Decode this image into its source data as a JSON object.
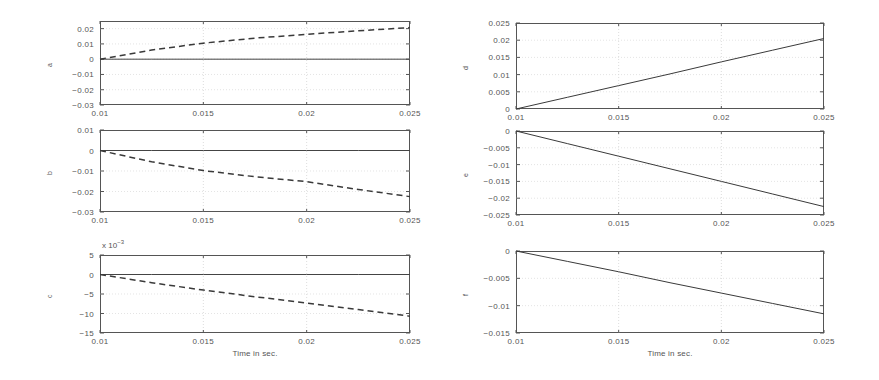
{
  "figure": {
    "background": "#ffffff",
    "ink_color": "#3a3a3a",
    "grid_color": "#cfcfcf"
  },
  "axis_common": {
    "xlabel": "Time in sec.",
    "xticks": [
      "0.01",
      "0.015",
      "0.02",
      "0.025"
    ],
    "xlim": [
      0.01,
      0.025
    ]
  },
  "chart_data": [
    {
      "id": "panel-a",
      "type": "line",
      "title": "",
      "xlabel": "",
      "ylabel": "a",
      "xlim": [
        0.01,
        0.025
      ],
      "ylim": [
        -0.03,
        0.025
      ],
      "xticks": [
        "0.01",
        "0.015",
        "0.02",
        "0.025"
      ],
      "yticks": [
        "0.02",
        "0.01",
        "0",
        "-0.01",
        "-0.02",
        "-0.03"
      ],
      "ytick_values": [
        0.02,
        0.01,
        0,
        -0.01,
        -0.02,
        -0.03
      ],
      "grid": true,
      "legend": "none",
      "exponent_label": "",
      "series": [
        {
          "name": "zero-reference",
          "style": "solid",
          "x": [
            0.01,
            0.0125,
            0.015,
            0.0175,
            0.02,
            0.0225,
            0.025
          ],
          "values": [
            0,
            0,
            0,
            0,
            0,
            0,
            0
          ]
        },
        {
          "name": "a-dashed",
          "style": "dashed",
          "x": [
            0.01,
            0.0125,
            0.015,
            0.0175,
            0.02,
            0.0225,
            0.025
          ],
          "values": [
            0.0,
            0.006,
            0.0105,
            0.0138,
            0.0163,
            0.0186,
            0.0207
          ]
        }
      ]
    },
    {
      "id": "panel-b",
      "type": "line",
      "title": "",
      "xlabel": "",
      "ylabel": "b",
      "xlim": [
        0.01,
        0.025
      ],
      "ylim": [
        -0.03,
        0.01
      ],
      "xticks": [
        "0.01",
        "0.015",
        "0.02",
        "0.025"
      ],
      "yticks": [
        "0.01",
        "0",
        "-0.01",
        "-0.02",
        "-0.03"
      ],
      "ytick_values": [
        0.01,
        0,
        -0.01,
        -0.02,
        -0.03
      ],
      "grid": true,
      "legend": "none",
      "exponent_label": "",
      "series": [
        {
          "name": "zero-reference",
          "style": "solid",
          "x": [
            0.01,
            0.0125,
            0.015,
            0.0175,
            0.02,
            0.0225,
            0.025
          ],
          "values": [
            0,
            0,
            0,
            0,
            0,
            0,
            0
          ]
        },
        {
          "name": "b-dashed",
          "style": "dashed",
          "x": [
            0.01,
            0.0125,
            0.015,
            0.0175,
            0.02,
            0.0225,
            0.025
          ],
          "values": [
            0.0,
            -0.0055,
            -0.0098,
            -0.0128,
            -0.0152,
            -0.019,
            -0.0225
          ]
        }
      ]
    },
    {
      "id": "panel-c",
      "type": "line",
      "title": "",
      "xlabel": "Time in sec.",
      "ylabel": "c",
      "xlim": [
        0.01,
        0.025
      ],
      "ylim": [
        -15,
        5
      ],
      "xticks": [
        "0.01",
        "0.015",
        "0.02",
        "0.025"
      ],
      "yticks": [
        "5",
        "0",
        "-5",
        "-10",
        "-15"
      ],
      "ytick_values": [
        5,
        0,
        -5,
        -10,
        -15
      ],
      "grid": true,
      "legend": "none",
      "exponent_label": "x 10",
      "exponent_power": "-3",
      "series": [
        {
          "name": "zero-reference",
          "style": "solid",
          "x": [
            0.01,
            0.0125,
            0.015,
            0.0175,
            0.02,
            0.0225,
            0.025
          ],
          "values": [
            0,
            0,
            0,
            0,
            0,
            0,
            0
          ]
        },
        {
          "name": "c-dashed",
          "style": "dashed",
          "x": [
            0.01,
            0.0125,
            0.015,
            0.0175,
            0.02,
            0.0225,
            0.025
          ],
          "values": [
            0.0,
            -2.1,
            -4.0,
            -5.7,
            -7.3,
            -9.0,
            -10.7
          ]
        }
      ]
    },
    {
      "id": "panel-d",
      "type": "line",
      "title": "",
      "xlabel": "",
      "ylabel": "d",
      "xlim": [
        0.01,
        0.025
      ],
      "ylim": [
        0,
        0.025
      ],
      "xticks": [
        "0.01",
        "0.015",
        "0.02",
        "0.025"
      ],
      "yticks": [
        "0.025",
        "0.02",
        "0.015",
        "0.01",
        "0.005",
        "0"
      ],
      "ytick_values": [
        0.025,
        0.02,
        0.015,
        0.01,
        0.005,
        0
      ],
      "grid": true,
      "legend": "none",
      "exponent_label": "",
      "series": [
        {
          "name": "d-solid",
          "style": "solid",
          "x": [
            0.01,
            0.0125,
            0.015,
            0.0175,
            0.02,
            0.0225,
            0.025
          ],
          "values": [
            0.0,
            0.0034,
            0.0068,
            0.0102,
            0.0137,
            0.0171,
            0.0205
          ]
        }
      ]
    },
    {
      "id": "panel-e",
      "type": "line",
      "title": "",
      "xlabel": "",
      "ylabel": "e",
      "xlim": [
        0.01,
        0.025
      ],
      "ylim": [
        -0.025,
        0
      ],
      "xticks": [
        "0.01",
        "0.015",
        "0.02",
        "0.025"
      ],
      "yticks": [
        "0",
        "-0.005",
        "-0.01",
        "-0.015",
        "-0.02",
        "-0.025"
      ],
      "ytick_values": [
        0,
        -0.005,
        -0.01,
        -0.015,
        -0.02,
        -0.025
      ],
      "grid": true,
      "legend": "none",
      "exponent_label": "",
      "series": [
        {
          "name": "e-solid",
          "style": "solid",
          "x": [
            0.01,
            0.0125,
            0.015,
            0.0175,
            0.02,
            0.0225,
            0.025
          ],
          "values": [
            0.0,
            -0.00375,
            -0.0075,
            -0.01125,
            -0.015,
            -0.01875,
            -0.0225
          ]
        }
      ]
    },
    {
      "id": "panel-f",
      "type": "line",
      "title": "",
      "xlabel": "Time in sec.",
      "ylabel": "f",
      "xlim": [
        0.01,
        0.025
      ],
      "ylim": [
        -0.015,
        0
      ],
      "xticks": [
        "0.01",
        "0.015",
        "0.02",
        "0.025"
      ],
      "yticks": [
        "0",
        "-0.005",
        "-0.01",
        "-0.015"
      ],
      "ytick_values": [
        0,
        -0.005,
        -0.01,
        -0.015
      ],
      "grid": true,
      "legend": "none",
      "exponent_label": "",
      "series": [
        {
          "name": "f-solid",
          "style": "solid",
          "x": [
            0.01,
            0.0125,
            0.015,
            0.0175,
            0.02,
            0.0225,
            0.025
          ],
          "values": [
            0.0,
            -0.0019,
            -0.0038,
            -0.0058,
            -0.0077,
            -0.0096,
            -0.0115
          ]
        }
      ]
    }
  ]
}
